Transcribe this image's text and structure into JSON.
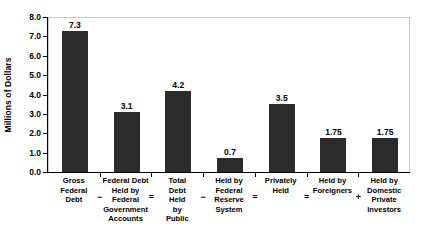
{
  "chart_data": {
    "type": "bar",
    "title": "",
    "xlabel": "",
    "ylabel": "Millions of Dollars",
    "ylim": [
      0.0,
      8.0
    ],
    "grid": false,
    "legend": "none",
    "yticks": [
      "8.0",
      "7.0",
      "6.0",
      "5.0",
      "4.0",
      "3.0",
      "2.0",
      "1.0",
      "0.0"
    ],
    "ytick_values": [
      8.0,
      7.0,
      6.0,
      5.0,
      4.0,
      3.0,
      2.0,
      1.0,
      0.0
    ],
    "categories": [
      "Gross Federal Debt",
      "Federal Debt Held by Federal Government Accounts",
      "Total Debt Held by Public",
      "Held by Federal Reserve System",
      "Privately Held",
      "Held by Foreigners",
      "Held by Domestic Private Investors"
    ],
    "values": [
      7.3,
      3.1,
      4.2,
      0.7,
      3.5,
      1.75,
      1.75
    ],
    "value_labels": [
      "7.3",
      "3.1",
      "4.2",
      "0.7",
      "3.5",
      "1.75",
      "1.75"
    ],
    "operators": [
      "−",
      "=",
      "−",
      "=",
      "=",
      "+"
    ],
    "bar_color": "#2b2b2b",
    "axis_color": "#000000",
    "frame_color": "#c8c8c8",
    "background_color": "#ffffff"
  },
  "category_lines": [
    [
      "Gross",
      "Federal",
      "Debt"
    ],
    [
      "Federal Debt",
      "Held by",
      "Federal",
      "Government",
      "Accounts"
    ],
    [
      "Total",
      "Debt",
      "Held",
      "by",
      "Public"
    ],
    [
      "Held by",
      "Federal",
      "Reserve",
      "System"
    ],
    [
      "Privately",
      "Held"
    ],
    [
      "Held by",
      "Foreigners"
    ],
    [
      "Held by",
      "Domestic",
      "Private",
      "Investors"
    ]
  ]
}
